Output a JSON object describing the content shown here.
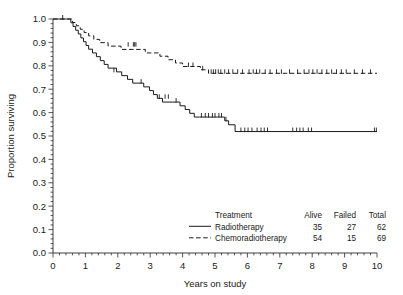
{
  "chart_data": {
    "type": "line",
    "title": "",
    "xlabel": "Years on study",
    "ylabel": "Proportion surviving",
    "xlim": [
      0,
      10
    ],
    "ylim": [
      0.0,
      1.0
    ],
    "grid": false,
    "legend_position": "bottom-right",
    "x_ticks": [
      "0",
      "1",
      "2",
      "3",
      "4",
      "5",
      "6",
      "7",
      "8",
      "9",
      "10"
    ],
    "x_tick_values": [
      0,
      1,
      2,
      3,
      4,
      5,
      6,
      7,
      8,
      9,
      10
    ],
    "x_minor_ticks_per_interval": 4,
    "y_ticks": [
      "0.0",
      "0.1",
      "0.2",
      "0.3",
      "0.4",
      "0.5",
      "0.6",
      "0.7",
      "0.8",
      "0.9",
      "1.0"
    ],
    "y_tick_values": [
      0.0,
      0.1,
      0.2,
      0.3,
      0.4,
      0.5,
      0.6,
      0.7,
      0.8,
      0.9,
      1.0
    ],
    "y_minor_ticks_per_interval": 4,
    "series": [
      {
        "name": "Radiotherapy",
        "style": "solid",
        "color": "#1a1a1a",
        "x": [
          0.0,
          0.42,
          0.55,
          0.62,
          0.7,
          0.78,
          0.86,
          0.94,
          1.02,
          1.1,
          1.22,
          1.34,
          1.46,
          1.58,
          1.7,
          1.82,
          1.96,
          2.12,
          2.3,
          2.46,
          2.62,
          2.8,
          2.98,
          3.1,
          3.22,
          3.38,
          3.7,
          3.92,
          4.08,
          4.22,
          4.36,
          4.52,
          5.08,
          5.3,
          5.42,
          5.62,
          10.0
        ],
        "y": [
          1.0,
          1.0,
          0.984,
          0.968,
          0.952,
          0.936,
          0.919,
          0.903,
          0.887,
          0.871,
          0.855,
          0.839,
          0.822,
          0.806,
          0.79,
          0.79,
          0.774,
          0.758,
          0.742,
          0.726,
          0.726,
          0.71,
          0.694,
          0.677,
          0.661,
          0.645,
          0.645,
          0.629,
          0.613,
          0.597,
          0.581,
          0.581,
          0.581,
          0.565,
          0.548,
          0.519,
          0.519
        ],
        "censored_x": [
          1.88,
          2.72,
          3.28,
          3.46,
          3.56,
          3.8,
          4.58,
          4.7,
          4.8,
          4.92,
          5.0,
          5.12,
          5.2,
          5.34,
          5.8,
          5.92,
          6.02,
          6.14,
          6.3,
          6.42,
          6.52,
          6.62,
          7.4,
          7.52,
          7.62,
          7.72,
          7.88,
          7.98,
          9.92,
          9.98
        ],
        "censored_y": [
          0.774,
          0.726,
          0.661,
          0.661,
          0.661,
          0.645,
          0.581,
          0.581,
          0.581,
          0.581,
          0.581,
          0.581,
          0.581,
          0.565,
          0.519,
          0.519,
          0.519,
          0.519,
          0.519,
          0.519,
          0.519,
          0.519,
          0.519,
          0.519,
          0.519,
          0.519,
          0.519,
          0.519,
          0.519,
          0.519
        ]
      },
      {
        "name": "Chemoradiotherapy",
        "style": "dashed",
        "color": "#1a1a1a",
        "x": [
          0.0,
          0.48,
          0.6,
          0.72,
          0.84,
          0.96,
          1.1,
          1.26,
          1.44,
          1.7,
          1.95,
          2.1,
          2.55,
          2.85,
          3.1,
          3.3,
          3.55,
          3.78,
          4.0,
          4.25,
          4.55,
          4.8,
          10.0
        ],
        "y": [
          1.0,
          1.0,
          0.985,
          0.971,
          0.956,
          0.942,
          0.928,
          0.913,
          0.899,
          0.884,
          0.884,
          0.87,
          0.87,
          0.855,
          0.855,
          0.841,
          0.826,
          0.812,
          0.797,
          0.797,
          0.783,
          0.768,
          0.768
        ],
        "censored_x": [
          0.3,
          2.32,
          2.48,
          2.52,
          2.56,
          4.18,
          4.32,
          4.62,
          4.88,
          4.95,
          5.02,
          5.1,
          5.18,
          5.3,
          5.42,
          5.55,
          5.7,
          5.85,
          6.05,
          6.18,
          6.28,
          6.38,
          6.55,
          6.7,
          6.9,
          7.05,
          7.3,
          7.55,
          7.75,
          7.9,
          8.02,
          8.15,
          8.3,
          8.45,
          8.6,
          8.75,
          8.9,
          9.05,
          9.3,
          9.55,
          9.8
        ],
        "censored_y": [
          1.0,
          0.884,
          0.884,
          0.884,
          0.884,
          0.797,
          0.797,
          0.783,
          0.768,
          0.768,
          0.768,
          0.768,
          0.768,
          0.768,
          0.768,
          0.768,
          0.768,
          0.768,
          0.768,
          0.768,
          0.768,
          0.768,
          0.768,
          0.768,
          0.768,
          0.768,
          0.768,
          0.768,
          0.768,
          0.768,
          0.768,
          0.768,
          0.768,
          0.768,
          0.768,
          0.768,
          0.768,
          0.768,
          0.768,
          0.768,
          0.768
        ]
      }
    ]
  },
  "legend": {
    "header": {
      "treatment": "Treatment",
      "alive": "Alive",
      "failed": "Failed",
      "total": "Total"
    },
    "rows": [
      {
        "label": "Radiotherapy",
        "alive": "35",
        "failed": "27",
        "total": "62",
        "style": "solid"
      },
      {
        "label": "Chemoradiotherapy",
        "alive": "54",
        "failed": "15",
        "total": "69",
        "style": "dashed"
      }
    ]
  },
  "axes": {
    "x_label": "Years on study",
    "y_label": "Proportion surviving"
  },
  "colors": {
    "axis": "#2b2b2b",
    "curve": "#1a1a1a",
    "background": "#ffffff"
  }
}
